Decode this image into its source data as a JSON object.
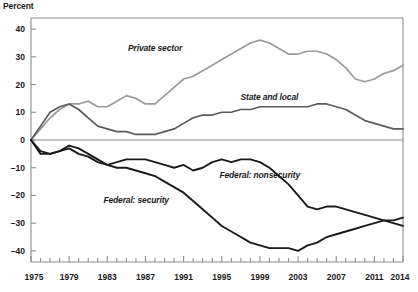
{
  "chart_data": {
    "type": "line",
    "title": "",
    "ylabel": "Percent",
    "xlabel": "",
    "ylim": [
      -44,
      44
    ],
    "xlim": [
      1975,
      2014
    ],
    "yticks": [
      40,
      30,
      20,
      10,
      0,
      -10,
      -20,
      -30,
      -40
    ],
    "ytick_labels": [
      "40",
      "30",
      "20",
      "10",
      "0",
      "–10",
      "–20",
      "–30",
      "–40"
    ],
    "xticks": [
      1975,
      1979,
      1983,
      1987,
      1991,
      1995,
      1999,
      2003,
      2007,
      2011,
      2014
    ],
    "xtick_labels": [
      "1975",
      "1979",
      "1983",
      "1987",
      "1991",
      "1995",
      "1999",
      "2003",
      "2007",
      "2011",
      "2014"
    ],
    "xtick_minor_step": 1,
    "grid": false,
    "zero_line": true,
    "legend_position": "inline-annotations",
    "x": [
      1975,
      1976,
      1977,
      1978,
      1979,
      1980,
      1981,
      1982,
      1983,
      1984,
      1985,
      1986,
      1987,
      1988,
      1989,
      1990,
      1991,
      1992,
      1993,
      1994,
      1995,
      1996,
      1997,
      1998,
      1999,
      2000,
      2001,
      2002,
      2003,
      2004,
      2005,
      2006,
      2007,
      2008,
      2009,
      2010,
      2011,
      2012,
      2013,
      2014
    ],
    "series": [
      {
        "name": "Private sector",
        "color": "#9a9a9a",
        "label_x": 1988,
        "label_y": 33,
        "values": [
          0,
          4,
          8,
          11,
          13,
          13,
          14,
          12,
          12,
          14,
          16,
          15,
          13,
          13,
          16,
          19,
          22,
          23,
          25,
          27,
          29,
          31,
          33,
          35,
          36,
          35,
          33,
          31,
          31,
          32,
          32,
          31,
          29,
          26,
          22,
          21,
          22,
          24,
          25,
          27
        ]
      },
      {
        "name": "State and local",
        "color": "#5a5a5a",
        "label_x": 2000,
        "label_y": 15,
        "values": [
          0,
          5,
          10,
          12,
          13,
          11,
          8,
          5,
          4,
          3,
          3,
          2,
          2,
          2,
          3,
          4,
          6,
          8,
          9,
          9,
          10,
          10,
          11,
          11,
          12,
          12,
          12,
          12,
          12,
          12,
          13,
          13,
          12,
          11,
          9,
          7,
          6,
          5,
          4,
          4
        ]
      },
      {
        "name": "Federal: nonsecurity",
        "color": "#1a1a1a",
        "label_x": 1999,
        "label_y": -13,
        "values": [
          0,
          -4,
          -5,
          -4,
          -3,
          -5,
          -6,
          -8,
          -9,
          -8,
          -7,
          -7,
          -7,
          -8,
          -9,
          -10,
          -9,
          -11,
          -10,
          -8,
          -7,
          -8,
          -7,
          -7,
          -8,
          -10,
          -13,
          -16,
          -20,
          -24,
          -25,
          -24,
          -24,
          -25,
          -26,
          -27,
          -28,
          -29,
          -30,
          -31
        ]
      },
      {
        "name": "Federal: security",
        "color": "#1a1a1a",
        "label_x": 1986,
        "label_y": -22,
        "values": [
          0,
          -5,
          -5,
          -4,
          -2,
          -3,
          -5,
          -7,
          -9,
          -10,
          -10,
          -11,
          -12,
          -13,
          -15,
          -17,
          -19,
          -22,
          -25,
          -28,
          -31,
          -33,
          -35,
          -37,
          -38,
          -39,
          -39,
          -39,
          -40,
          -38,
          -37,
          -35,
          -34,
          -33,
          -32,
          -31,
          -30,
          -29,
          -29,
          -28
        ]
      }
    ]
  },
  "plot": {
    "left": 31,
    "right": 403,
    "top": 18,
    "bottom": 262
  }
}
